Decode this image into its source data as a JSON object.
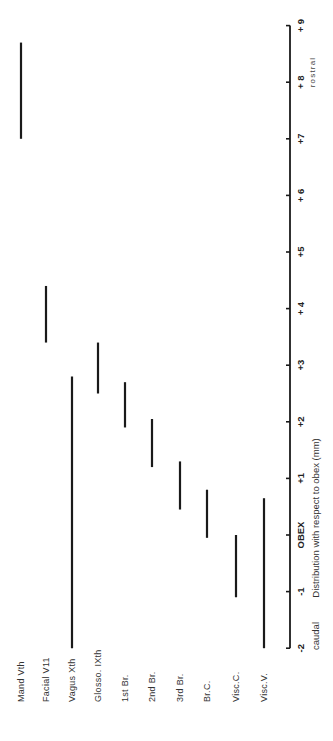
{
  "chart_data": {
    "type": "bar",
    "orientation": "range-bars (floating), figure rotated 90 degrees",
    "title": "",
    "xlabel": "Distribution with respect to obex (mm)",
    "ylabel": "",
    "axis_range": [
      -2,
      9
    ],
    "ticks": [
      {
        "value": -2,
        "label": "-2"
      },
      {
        "value": -1,
        "label": "-1"
      },
      {
        "value": 0,
        "label": "OBEX"
      },
      {
        "value": 1,
        "label": "+1"
      },
      {
        "value": 2,
        "label": "+2"
      },
      {
        "value": 3,
        "label": "+3"
      },
      {
        "value": 4,
        "label": "+ 4"
      },
      {
        "value": 5,
        "label": "+5"
      },
      {
        "value": 6,
        "label": "+ 6"
      },
      {
        "value": 7,
        "label": "+7"
      },
      {
        "value": 8,
        "label": "+ 8"
      },
      {
        "value": 9,
        "label": "+ 9"
      }
    ],
    "annotations": {
      "caudal": "caudal",
      "rostral": "rostral"
    },
    "categories": [
      "Mand Vth",
      "Facial V11",
      "Vagus  Xth",
      "Glosso. IXth",
      "1st Br.",
      "2nd Br.",
      "3rd Br.",
      "Br.C.",
      "Visc.C.",
      "Visc.V."
    ],
    "series": [
      {
        "name": "distribution range (mm)",
        "ranges": [
          {
            "category": "Mand Vth",
            "start": 7.0,
            "end": 8.7
          },
          {
            "category": "Facial V11",
            "start": 3.4,
            "end": 4.4
          },
          {
            "category": "Vagus  Xth",
            "start": -2.0,
            "end": 2.8
          },
          {
            "category": "Glosso. IXth",
            "start": 2.5,
            "end": 3.4
          },
          {
            "category": "1st Br.",
            "start": 1.9,
            "end": 2.7
          },
          {
            "category": "2nd Br.",
            "start": 1.2,
            "end": 2.05
          },
          {
            "category": "3rd Br.",
            "start": 0.45,
            "end": 1.3
          },
          {
            "category": "Br.C.",
            "start": -0.05,
            "end": 0.8
          },
          {
            "category": "Visc.C.",
            "start": -1.1,
            "end": 0.0
          },
          {
            "category": "Visc.V.",
            "start": -2.0,
            "end": 0.65
          }
        ]
      }
    ],
    "grid": false,
    "legend": null
  },
  "layout": {
    "axis_x": 290,
    "zero_y": 535,
    "px_per_unit": 56.6,
    "category_x": [
      21,
      46,
      72,
      98,
      125,
      152,
      180,
      207,
      236,
      264
    ],
    "label_baseline_y": 702
  },
  "colors": {
    "ink": "#1a1a1a",
    "background": "#ffffff"
  }
}
